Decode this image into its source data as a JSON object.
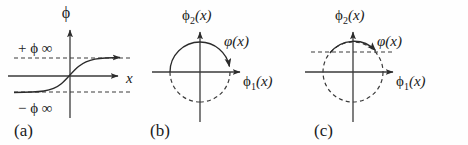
{
  "figure": {
    "width": 468,
    "height": 145,
    "background_color": "#fefefe",
    "ink_color": "#2b2b2b"
  },
  "panels": [
    {
      "id": "a",
      "label": "(a)",
      "label_pos": {
        "x": 14,
        "y": 133
      },
      "type": "kink-profile-plot",
      "description": "Sigmoid (kink) field profile phi(x) interpolating between minus phi-infinity and plus phi-infinity",
      "axes": {
        "vertical_label": "ϕ",
        "vertical_label_pos": {
          "x": 66,
          "y": 16
        },
        "horizontal_label": "x",
        "horizontal_label_pos": {
          "x": 128,
          "y": 82
        },
        "origin": {
          "x": 70,
          "y": 76
        },
        "vertical_extent": {
          "top": 26,
          "bottom": 118
        },
        "horizontal_extent": {
          "left": 8,
          "right": 122
        }
      },
      "asymptotes": [
        {
          "name": "upper-asymptote",
          "sign": "+",
          "symbol": "ϕ",
          "subscript": "∞",
          "text": "+ ϕ ∞",
          "y": 58,
          "label_pos": {
            "x": 18,
            "y": 52
          },
          "line_from_x": 14,
          "line_to_x": 132
        },
        {
          "name": "lower-asymptote",
          "sign": "−",
          "symbol": "ϕ",
          "subscript": "∞",
          "text": "− ϕ ∞",
          "y": 92,
          "label_pos": {
            "x": 18,
            "y": 112
          },
          "line_from_x": 14,
          "line_to_x": 132
        }
      ],
      "curve": {
        "name": "kink-sigmoid-curve",
        "path": "M 14 92 C 42 92 52 91 62 83 C 68 78 72 73 78 68 C 88 59 98 58 124 58",
        "arrow_at": {
          "x": 124,
          "y": 58,
          "direction": "right"
        }
      }
    },
    {
      "id": "b",
      "label": "(b)",
      "label_pos": {
        "x": 150,
        "y": 133
      },
      "type": "vacuum-manifold-circle",
      "description": "Circle of degenerate vacua in (phi1, phi2) plane; field vector winds along the upper solid arc ending at the positive phi1 axis",
      "axes": {
        "horizontal_label": "ϕ₁(x)",
        "horizontal_label_base": "ϕ",
        "horizontal_label_sub": "1",
        "horizontal_label_arg": "(x)",
        "horizontal_label_pos": {
          "x": 243,
          "y": 84
        },
        "vertical_label": "ϕ₂(x)",
        "vertical_label_base": "ϕ",
        "vertical_label_sub": "2",
        "vertical_label_arg": "(x)",
        "vertical_label_pos": {
          "x": 182,
          "y": 18
        },
        "origin": {
          "x": 200,
          "y": 72
        },
        "vertical_extent": {
          "top": 28,
          "bottom": 122
        },
        "horizontal_extent": {
          "left": 152,
          "right": 244
        }
      },
      "circle": {
        "center": {
          "x": 200,
          "y": 72
        },
        "radius": 30,
        "solid_arc_start_deg": 180,
        "solid_arc_end_deg": 0,
        "solid_arc_sweep": "over-the-top",
        "dashed_arc": "lower-half"
      },
      "vector": {
        "name": "field-vector",
        "symbol": "φ(x)",
        "label_pos": {
          "x": 224,
          "y": 42
        },
        "arrow_tip_angle_deg": 0,
        "arrow_tip": {
          "x": 230,
          "y": 72
        },
        "arrow_direction": "clockwise-into-positive-phi1"
      },
      "dashed_horizontal": null
    },
    {
      "id": "c",
      "label": "(c)",
      "label_pos": {
        "x": 314,
        "y": 133
      },
      "type": "vacuum-manifold-circle",
      "description": "Same vacuum circle; the field vector now stops partway along the upper arc at about 45 degrees, with a dashed horizontal level line through that point",
      "axes": {
        "horizontal_label": "ϕ₁(x)",
        "horizontal_label_base": "ϕ",
        "horizontal_label_sub": "1",
        "horizontal_label_arg": "(x)",
        "horizontal_label_pos": {
          "x": 396,
          "y": 84
        },
        "vertical_label": "ϕ₂(x)",
        "vertical_label_base": "ϕ",
        "vertical_label_sub": "2",
        "vertical_label_arg": "(x)",
        "vertical_label_pos": {
          "x": 335,
          "y": 18
        },
        "origin": {
          "x": 353,
          "y": 72
        },
        "vertical_extent": {
          "top": 28,
          "bottom": 122
        },
        "horizontal_extent": {
          "left": 305,
          "right": 397
        }
      },
      "circle": {
        "center": {
          "x": 353,
          "y": 72
        },
        "radius": 30,
        "solid_arc_start_deg": 140,
        "solid_arc_end_deg": 42,
        "solid_arc_sweep": "over-the-top",
        "dashed_arc": "remainder-full-circle"
      },
      "vector": {
        "name": "field-vector",
        "symbol": "φ(x)",
        "label_pos": {
          "x": 377,
          "y": 42
        },
        "arrow_tip_angle_deg": 42,
        "arrow_tip": {
          "x": 375,
          "y": 52
        },
        "arrow_direction": "clockwise-along-upper-arc"
      },
      "dashed_horizontal": {
        "name": "level-line",
        "y": 52,
        "from_x": 311,
        "to_x": 393
      }
    }
  ]
}
